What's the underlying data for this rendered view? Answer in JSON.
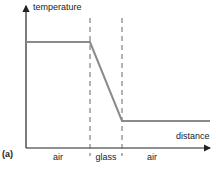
{
  "figure": {
    "panel_label": "(a)",
    "y_axis_label": "temperature",
    "x_axis_label": "distance",
    "regions": [
      "air",
      "glass",
      "air"
    ],
    "profile": {
      "description": "Temperature constant and high in first air region, drops linearly through glass, constant and low in second air region",
      "levels": [
        "high",
        "linear decrease",
        "low"
      ]
    },
    "colors": {
      "axis": "#222222",
      "curve": "#8a8a8a",
      "boundary": "#666666"
    }
  }
}
